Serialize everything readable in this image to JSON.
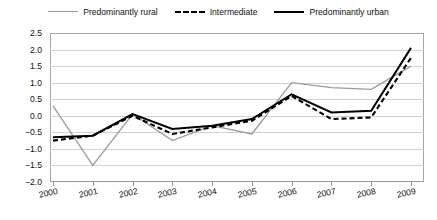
{
  "legend": {
    "position": "top-center",
    "items": [
      {
        "label": "Predominantly rural",
        "style": "solid",
        "color": "#9a9a9a",
        "icon": "line-swatch-icon"
      },
      {
        "label": "Intermediate",
        "style": "dashed",
        "color": "#000000",
        "icon": "line-swatch-icon"
      },
      {
        "label": "Predominantly urban",
        "style": "solid",
        "color": "#000000",
        "icon": "line-swatch-icon"
      }
    ]
  },
  "axes": {
    "y_ticks": [
      "2.5",
      "2.0",
      "1.5",
      "1.0",
      "0.5",
      "0.0",
      "-0.5",
      "-1.0",
      "-1.5",
      "-2.0"
    ],
    "x_ticks": [
      "2000",
      "2001",
      "2002",
      "2003",
      "2004",
      "2005",
      "2006",
      "2007",
      "2008",
      "2009"
    ]
  },
  "chart_data": {
    "type": "line",
    "title": "",
    "subtitle": "",
    "xlabel": "",
    "ylabel": "",
    "grid": true,
    "legend_position": "top-center",
    "categories": [
      "2000",
      "2001",
      "2002",
      "2003",
      "2004",
      "2005",
      "2006",
      "2007",
      "2008",
      "2009"
    ],
    "x": [
      2000,
      2001,
      2002,
      2003,
      2004,
      2005,
      2006,
      2007,
      2008,
      2009
    ],
    "ylim": [
      -2.0,
      2.5
    ],
    "xlim": [
      2000,
      2009
    ],
    "ytick_step": 0.5,
    "series": [
      {
        "name": "Predominantly rural",
        "style": "solid",
        "color": "#9a9a9a",
        "values": [
          0.3,
          -1.5,
          0.05,
          -0.75,
          -0.3,
          -0.55,
          1.0,
          0.85,
          0.8,
          1.5
        ]
      },
      {
        "name": "Intermediate",
        "style": "dashed",
        "color": "#000000",
        "values": [
          -0.75,
          -0.6,
          0.0,
          -0.55,
          -0.35,
          -0.15,
          0.6,
          -0.1,
          -0.05,
          1.75
        ]
      },
      {
        "name": "Predominantly urban",
        "style": "solid",
        "color": "#000000",
        "values": [
          -0.65,
          -0.6,
          0.05,
          -0.4,
          -0.3,
          -0.1,
          0.65,
          0.1,
          0.15,
          2.05
        ]
      }
    ]
  }
}
